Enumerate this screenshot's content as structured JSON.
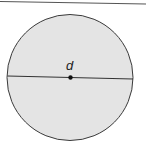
{
  "diagram": {
    "type": "circle-diameter",
    "label": "d",
    "colors": {
      "fill": "#e4e4e4",
      "stroke": "#3a3a3a",
      "top_rule": "#555555"
    }
  }
}
